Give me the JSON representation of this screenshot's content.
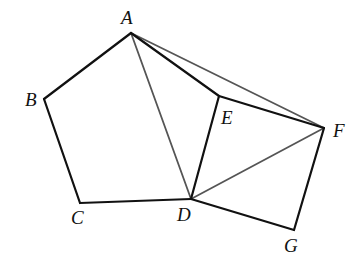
{
  "diagram": {
    "title": "",
    "colors": {
      "primary_line": "#111111",
      "secondary_line": "#555555",
      "background": "#ffffff"
    },
    "points": {
      "A": {
        "label": "A",
        "x": 131,
        "y": 33,
        "lx": 121,
        "ly": 24
      },
      "B": {
        "label": "B",
        "x": 44,
        "y": 99,
        "lx": 25,
        "ly": 106
      },
      "C": {
        "label": "C",
        "x": 80,
        "y": 203,
        "lx": 71,
        "ly": 224
      },
      "D": {
        "label": "D",
        "x": 191,
        "y": 199,
        "lx": 177,
        "ly": 221
      },
      "E": {
        "label": "E",
        "x": 219,
        "y": 96,
        "lx": 221,
        "ly": 124
      },
      "F": {
        "label": "F",
        "x": 324,
        "y": 128,
        "lx": 333,
        "ly": 137
      },
      "G": {
        "label": "G",
        "x": 294,
        "y": 230,
        "lx": 284,
        "ly": 252
      }
    },
    "segments": [
      {
        "from": "A",
        "to": "B",
        "style": "primary"
      },
      {
        "from": "B",
        "to": "C",
        "style": "primary"
      },
      {
        "from": "C",
        "to": "D",
        "style": "primary"
      },
      {
        "from": "D",
        "to": "E",
        "style": "primary"
      },
      {
        "from": "E",
        "to": "A",
        "style": "primary"
      },
      {
        "from": "E",
        "to": "F",
        "style": "primary"
      },
      {
        "from": "F",
        "to": "G",
        "style": "primary"
      },
      {
        "from": "G",
        "to": "D",
        "style": "primary"
      },
      {
        "from": "A",
        "to": "D",
        "style": "secondary"
      },
      {
        "from": "A",
        "to": "F",
        "style": "secondary"
      },
      {
        "from": "D",
        "to": "F",
        "style": "secondary"
      }
    ],
    "shapes": [
      {
        "name": "pentagon",
        "vertices": [
          "A",
          "B",
          "C",
          "D",
          "E"
        ]
      },
      {
        "name": "square",
        "vertices": [
          "D",
          "E",
          "F",
          "G"
        ]
      }
    ]
  }
}
